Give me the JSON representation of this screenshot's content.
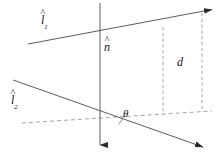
{
  "figure": {
    "type": "geometry-diagram",
    "background_color": "#ffffff",
    "stroke_color": "#3a3a3a",
    "text_color": "#111111",
    "width": 224,
    "height": 156,
    "labels": {
      "line1": {
        "base": "l",
        "accent": "^",
        "subscript": "1",
        "name": "l-hat-1"
      },
      "line2": {
        "base": "l",
        "accent": "^",
        "subscript": "2",
        "name": "l-hat-2"
      },
      "normal": {
        "base": "n",
        "accent": "^",
        "subscript": "",
        "name": "n-hat"
      },
      "distance": {
        "text": "d",
        "name": "distance-d"
      },
      "angle": {
        "text": "θ",
        "name": "angle-theta"
      }
    },
    "geometry": {
      "intersection_point": {
        "x": 100,
        "y": 117
      },
      "line1": {
        "x1": 28,
        "y1": 44,
        "x2": 214,
        "y2": 9,
        "arrow": "end"
      },
      "line2": {
        "x1": 13,
        "y1": 80,
        "x2": 205,
        "y2": 148,
        "arrow": "end"
      },
      "normal_axis": {
        "x1": 100,
        "y1": 3,
        "x2": 100,
        "y2": 148,
        "arrow": "end-down"
      },
      "dashed_baseline": {
        "x1": 22,
        "y1": 123,
        "x2": 212,
        "y2": 111
      },
      "dashed_vertical_inner": {
        "x": 163,
        "y1": 27,
        "y2": 115
      },
      "dashed_vertical_outer": {
        "x": 202,
        "y1": 13,
        "y2": 112
      },
      "angle_arc": {
        "cx": 100,
        "cy": 117,
        "radius": 24,
        "sweep_label": "θ"
      }
    }
  }
}
